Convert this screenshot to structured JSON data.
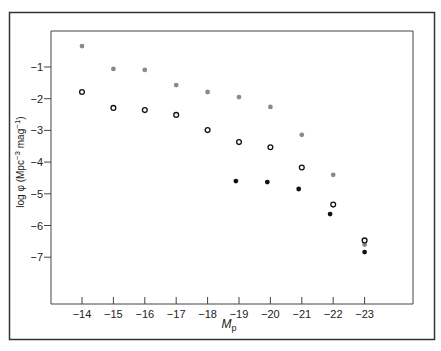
{
  "chart_data": {
    "type": "scatter",
    "title": "",
    "xlabel": "M_p",
    "xlabel_main": "M",
    "xlabel_sub": "p",
    "ylabel": "log φ (Mpc⁻³ mag⁻¹)",
    "ylabel_parts": {
      "pre": "log φ (Mpc",
      "sup1": "−3",
      "mid": " mag",
      "sup2": "−1",
      "post": ")"
    },
    "xlim": [
      -13.0,
      -24.5
    ],
    "ylim": [
      0.1,
      -8.6
    ],
    "x_ticks": [
      -14,
      -15,
      -16,
      -17,
      -18,
      -19,
      -20,
      -21,
      -22,
      -23
    ],
    "x_tick_labels": [
      "−14",
      "−15",
      "−16",
      "−17",
      "−18",
      "−19",
      "−20",
      "−21",
      "−22",
      "−23"
    ],
    "y_ticks": [
      -1,
      -2,
      -3,
      -4,
      -5,
      -6,
      -7
    ],
    "y_tick_labels": [
      "−1",
      "−2",
      "−3",
      "−4",
      "−5",
      "−6",
      "−7"
    ],
    "grid": false,
    "legend": null,
    "series": [
      {
        "name": "grey-filled",
        "marker": "filled-circle",
        "color": "#8a8a8a",
        "x": [
          -14,
          -15,
          -16,
          -17,
          -18,
          -19,
          -20,
          -21,
          -22,
          -23
        ],
        "y": [
          -0.34,
          -1.06,
          -1.09,
          -1.57,
          -1.79,
          -1.95,
          -2.26,
          -3.14,
          -4.4,
          -6.6
        ]
      },
      {
        "name": "open-circle",
        "marker": "open-circle",
        "color": "#111111",
        "x": [
          -14,
          -15,
          -16,
          -17,
          -18,
          -19,
          -20,
          -21,
          -22,
          -23
        ],
        "y": [
          -1.79,
          -2.29,
          -2.36,
          -2.51,
          -2.99,
          -3.37,
          -3.53,
          -4.17,
          -5.34,
          -6.47
        ]
      },
      {
        "name": "black-filled",
        "marker": "filled-circle",
        "color": "#111111",
        "x": [
          -18.9,
          -19.9,
          -20.9,
          -21.9,
          -23
        ],
        "y": [
          -4.6,
          -4.63,
          -4.85,
          -5.64,
          -6.84
        ]
      }
    ]
  },
  "colors": {
    "frame": "#333333",
    "axis": "#444444",
    "grey_marker": "#8a8a8a",
    "black_marker": "#111111"
  }
}
